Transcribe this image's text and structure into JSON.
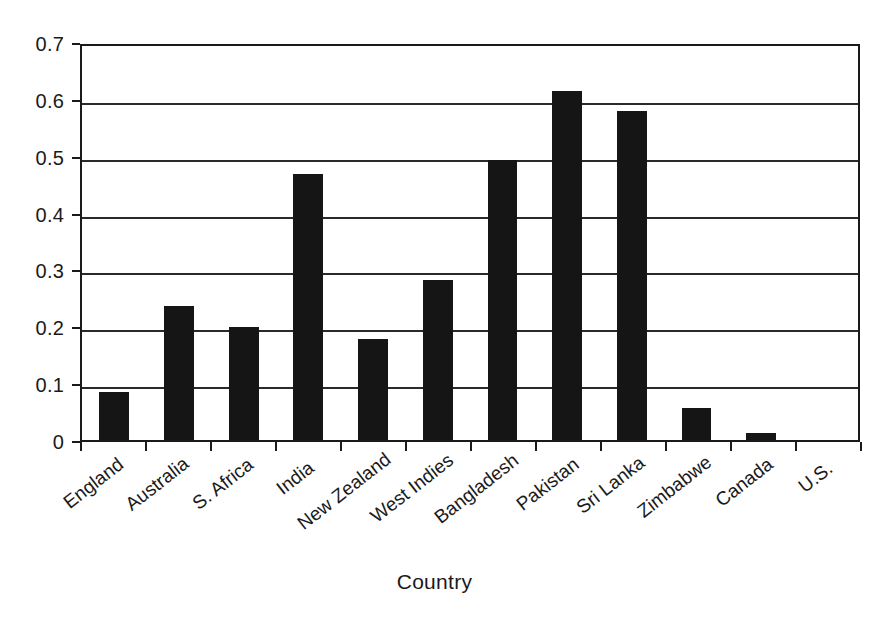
{
  "chart_data": {
    "type": "bar",
    "title": "",
    "xlabel": "Country",
    "ylabel": "",
    "ylim": [
      0,
      0.7
    ],
    "grid": true,
    "legend": "none",
    "orientation": "vertical",
    "bar_color": "#151515",
    "categories": [
      "England",
      "Australia",
      "S. Africa",
      "India",
      "New Zealand",
      "West Indies",
      "Bangladesh",
      "Pakistan",
      "Sri Lanka",
      "Zimbabwe",
      "Canada",
      "U.S."
    ],
    "values": [
      0.085,
      0.235,
      0.198,
      0.467,
      0.177,
      0.282,
      0.492,
      0.613,
      0.578,
      0.057,
      0.012,
      0.0
    ],
    "ytick_labels": [
      "0.7",
      "0.6",
      "0.5",
      "0.4",
      "0.3",
      "0.2",
      "0.1",
      "0"
    ],
    "ytick_values": [
      0.7,
      0.6,
      0.5,
      0.4,
      0.3,
      0.2,
      0.1,
      0
    ]
  },
  "axes": {
    "x_title": "Country"
  },
  "style": {
    "axis_color": "#1a1a1a",
    "grid_color": "#2a2a2a",
    "background": "#ffffff"
  }
}
